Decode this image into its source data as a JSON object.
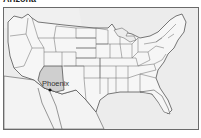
{
  "title": "Arizona",
  "map": {
    "highlighted_state": "Arizona",
    "colors": {
      "ocean": "#ececec",
      "land": "#f6f6f6",
      "highlight": "#cfcfcf",
      "border": "#555555",
      "frame": "#6a6a6a",
      "city_dot": "#111111"
    },
    "city": {
      "name": "Phoenix",
      "label": "Phoenix"
    }
  }
}
